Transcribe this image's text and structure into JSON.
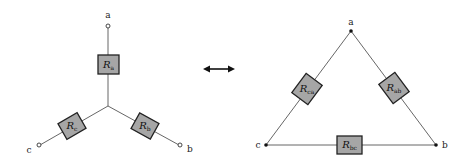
{
  "diagram": {
    "wye": {
      "nodes": {
        "a": "a",
        "b": "b",
        "c": "c"
      },
      "resistors": {
        "Ra": {
          "base": "R",
          "sub": "a"
        },
        "Rb": {
          "base": "R",
          "sub": "b"
        },
        "Rc": {
          "base": "R",
          "sub": "c"
        }
      }
    },
    "delta": {
      "nodes": {
        "a": "a",
        "b": "b",
        "c": "c"
      },
      "resistors": {
        "Rab": {
          "base": "R",
          "sub": "ab"
        },
        "Rbc": {
          "base": "R",
          "sub": "bc"
        },
        "Rca": {
          "base": "R",
          "sub": "ca"
        }
      }
    },
    "equivalence_arrow": "double-headed-arrow",
    "colors": {
      "resistor_fill": "#a6a6a6",
      "resistor_stroke": "#222222",
      "wire": "#555555",
      "background": "#ffffff"
    }
  }
}
